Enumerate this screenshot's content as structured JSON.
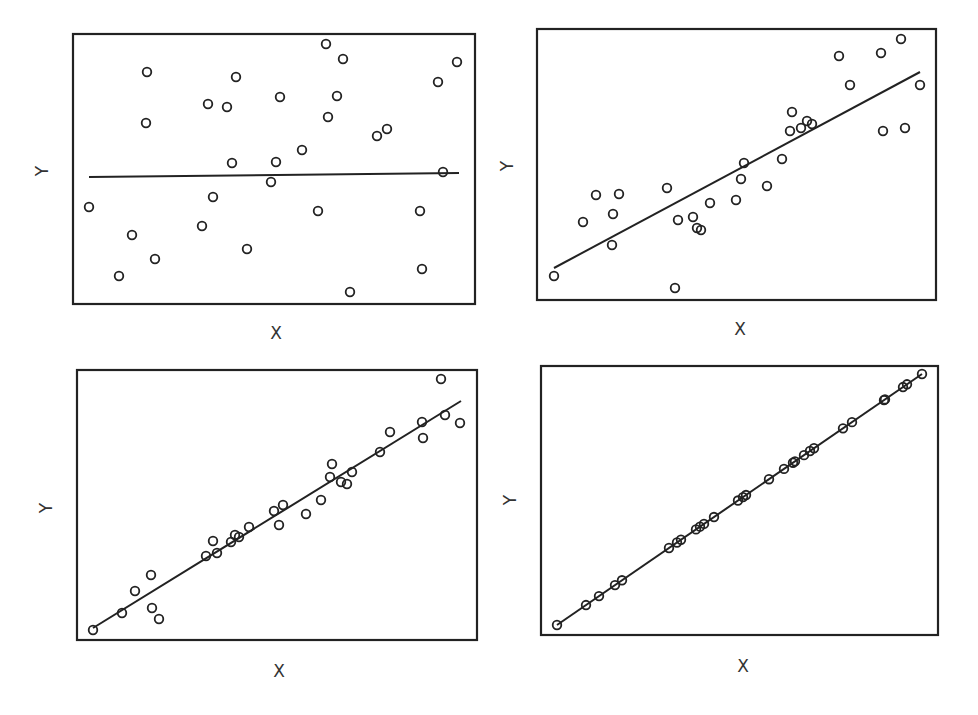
{
  "figure": {
    "background": "#ffffff",
    "ink_color": "#222222"
  },
  "chart_data": [
    {
      "type": "scatter",
      "title": "",
      "xlabel": "X",
      "ylabel": "Y",
      "grid": false,
      "legend": null,
      "frame": {
        "x0": 73,
        "y0": 34,
        "x1": 475,
        "y1": 304
      },
      "fit_line": {
        "x1": 89,
        "y1": 177,
        "x2": 459,
        "y2": 173
      },
      "points": [
        [
          89,
          207
        ],
        [
          119,
          276
        ],
        [
          132,
          235
        ],
        [
          147,
          72
        ],
        [
          146,
          123
        ],
        [
          155,
          259
        ],
        [
          202,
          226
        ],
        [
          208,
          104
        ],
        [
          213,
          197
        ],
        [
          227,
          107
        ],
        [
          236,
          77
        ],
        [
          232,
          163
        ],
        [
          247,
          249
        ],
        [
          271,
          182
        ],
        [
          276,
          162
        ],
        [
          280,
          97
        ],
        [
          302,
          150
        ],
        [
          318,
          211
        ],
        [
          326,
          44
        ],
        [
          328,
          117
        ],
        [
          337,
          96
        ],
        [
          343,
          59
        ],
        [
          350,
          292
        ],
        [
          377,
          136
        ],
        [
          387,
          129
        ],
        [
          420,
          211
        ],
        [
          422,
          269
        ],
        [
          438,
          82
        ],
        [
          443,
          172
        ],
        [
          457,
          62
        ]
      ],
      "x_label_pos": [
        276,
        334
      ],
      "y_label_pos": [
        43,
        171
      ]
    },
    {
      "type": "scatter",
      "title": "",
      "xlabel": "X",
      "ylabel": "Y",
      "grid": false,
      "legend": null,
      "frame": {
        "x0": 537,
        "y0": 29,
        "x1": 936,
        "y1": 300
      },
      "fit_line": {
        "x1": 554,
        "y1": 268,
        "x2": 920,
        "y2": 72
      },
      "points": [
        [
          554,
          276
        ],
        [
          583,
          222
        ],
        [
          596,
          195
        ],
        [
          613,
          214
        ],
        [
          612,
          245
        ],
        [
          619,
          194
        ],
        [
          667,
          188
        ],
        [
          675,
          288
        ],
        [
          678,
          220
        ],
        [
          693,
          217
        ],
        [
          697,
          228
        ],
        [
          701,
          230
        ],
        [
          710,
          203
        ],
        [
          736,
          200
        ],
        [
          741,
          179
        ],
        [
          744,
          163
        ],
        [
          767,
          186
        ],
        [
          782,
          159
        ],
        [
          790,
          131
        ],
        [
          792,
          112
        ],
        [
          801,
          128
        ],
        [
          807,
          121
        ],
        [
          812,
          124
        ],
        [
          839,
          56
        ],
        [
          850,
          85
        ],
        [
          881,
          53
        ],
        [
          883,
          131
        ],
        [
          901,
          39
        ],
        [
          905,
          128
        ],
        [
          920,
          85
        ]
      ],
      "x_label_pos": [
        740,
        330
      ],
      "y_label_pos": [
        508,
        166
      ]
    },
    {
      "type": "scatter",
      "title": "",
      "xlabel": "X",
      "ylabel": "Y",
      "grid": false,
      "legend": null,
      "frame": {
        "x0": 77,
        "y0": 370,
        "x1": 477,
        "y1": 640
      },
      "fit_line": {
        "x1": 93,
        "y1": 628,
        "x2": 461,
        "y2": 401
      },
      "points": [
        [
          93,
          630
        ],
        [
          122,
          613
        ],
        [
          135,
          591
        ],
        [
          151,
          575
        ],
        [
          152,
          608
        ],
        [
          159,
          619
        ],
        [
          206,
          556
        ],
        [
          213,
          541
        ],
        [
          217,
          553
        ],
        [
          231,
          542
        ],
        [
          235,
          535
        ],
        [
          239,
          537
        ],
        [
          249,
          527
        ],
        [
          274,
          511
        ],
        [
          279,
          525
        ],
        [
          283,
          505
        ],
        [
          306,
          514
        ],
        [
          321,
          500
        ],
        [
          330,
          477
        ],
        [
          332,
          464
        ],
        [
          341,
          482
        ],
        [
          347,
          484
        ],
        [
          352,
          472
        ],
        [
          380,
          452
        ],
        [
          390,
          432
        ],
        [
          422,
          422
        ],
        [
          423,
          438
        ],
        [
          441,
          379
        ],
        [
          445,
          415
        ],
        [
          460,
          423
        ]
      ],
      "x_label_pos": [
        279,
        672
      ],
      "y_label_pos": [
        47,
        508
      ]
    },
    {
      "type": "scatter",
      "title": "",
      "xlabel": "X",
      "ylabel": "Y",
      "grid": false,
      "legend": null,
      "frame": {
        "x0": 541,
        "y0": 366,
        "x1": 938,
        "y1": 635
      },
      "fit_line": {
        "x1": 557,
        "y1": 625,
        "x2": 922,
        "y2": 374
      },
      "point_x": [
        557,
        586,
        599,
        615,
        622,
        669,
        677,
        681,
        696,
        700,
        704,
        714,
        738,
        743,
        746,
        769,
        784,
        793,
        795,
        804,
        810,
        814,
        843,
        852,
        884,
        885,
        903,
        907,
        922
      ],
      "x_label_pos": [
        743,
        667
      ],
      "y_label_pos": [
        511,
        500
      ]
    }
  ]
}
